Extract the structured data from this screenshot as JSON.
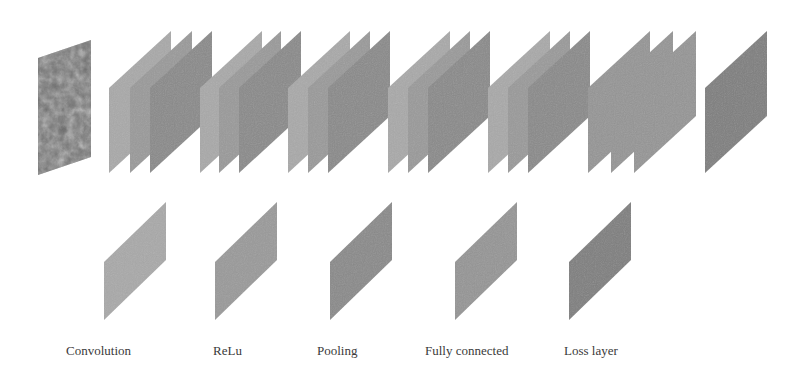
{
  "diagram": {
    "title": "",
    "type": "cnn-architecture",
    "colors": {
      "convolution": "#a9a9a9",
      "relu": "#9a9a9a",
      "pooling": "#8a8a8a",
      "fully_connected": "#959595",
      "loss_layer": "#7f7f7f",
      "input_image": "#6f6f6f"
    },
    "input": {
      "name": "input-image",
      "x": 38,
      "y_top_left": 58,
      "y_bottom_left": 175,
      "width": 53,
      "rise": 18
    },
    "pipeline": [
      {
        "group": 1,
        "panels": [
          {
            "type": "convolution",
            "x": 109
          },
          {
            "type": "relu",
            "x": 130
          },
          {
            "type": "pooling",
            "x": 150
          }
        ]
      },
      {
        "group": 2,
        "panels": [
          {
            "type": "convolution",
            "x": 200
          },
          {
            "type": "relu",
            "x": 219
          },
          {
            "type": "pooling",
            "x": 239
          }
        ]
      },
      {
        "group": 3,
        "panels": [
          {
            "type": "convolution",
            "x": 288
          },
          {
            "type": "relu",
            "x": 308
          },
          {
            "type": "pooling",
            "x": 328
          }
        ]
      },
      {
        "group": 4,
        "panels": [
          {
            "type": "convolution",
            "x": 388
          },
          {
            "type": "relu",
            "x": 408
          },
          {
            "type": "pooling",
            "x": 428
          }
        ]
      },
      {
        "group": 5,
        "panels": [
          {
            "type": "convolution",
            "x": 488
          },
          {
            "type": "relu",
            "x": 508
          },
          {
            "type": "pooling",
            "x": 528
          }
        ]
      },
      {
        "group": 6,
        "panels": [
          {
            "type": "fully_connected",
            "x": 588
          },
          {
            "type": "fully_connected",
            "x": 611
          },
          {
            "type": "fully_connected",
            "x": 634
          }
        ]
      },
      {
        "group": 7,
        "panels": [
          {
            "type": "loss_layer",
            "x": 705
          }
        ]
      }
    ],
    "top_panel_geometry": {
      "y_top_left": 88,
      "y_bottom_left": 173,
      "width": 62,
      "rise": 57
    },
    "legend": [
      {
        "type": "convolution",
        "label": "Convolution",
        "panel_x": 104,
        "label_x": 66
      },
      {
        "type": "relu",
        "label": "ReLu",
        "panel_x": 215,
        "label_x": 213
      },
      {
        "type": "pooling",
        "label": "Pooling",
        "panel_x": 330,
        "label_x": 317
      },
      {
        "type": "fully_connected",
        "label": "Fully connected",
        "panel_x": 455,
        "label_x": 425
      },
      {
        "type": "loss_layer",
        "label": "Loss layer",
        "panel_x": 569,
        "label_x": 564
      }
    ],
    "legend_panel_geometry": {
      "y_top_left": 262,
      "y_bottom_left": 320,
      "width": 62,
      "rise": 60
    },
    "legend_label_y": 343
  }
}
